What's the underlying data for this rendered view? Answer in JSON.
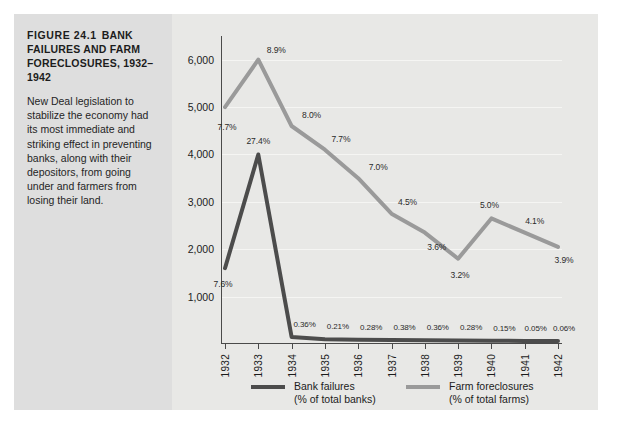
{
  "figure": {
    "number_label": "FIGURE 24.1",
    "title": "BANK FAILURES AND FARM FORECLOSURES, 1932–1942",
    "caption": "New Deal legislation to stabilize the economy had its most immediate and striking effect in preventing banks, along with their depositors, from going under and farmers from losing their land."
  },
  "colors": {
    "bank_failures": "#4c4c4c",
    "farm_foreclosures": "#9a9a9a",
    "panel_background": "#e8e8e6",
    "caption_background": "#dedede",
    "axis": "#4a4a4a",
    "gridline": "#f5f5f3"
  },
  "chart_data": {
    "type": "line",
    "title": "FIGURE 24.1 BANK FAILURES AND FARM FORECLOSURES, 1932–1942",
    "xlabel": "",
    "ylabel": "",
    "x": [
      "1932",
      "1933",
      "1934",
      "1935",
      "1936",
      "1937",
      "1938",
      "1939",
      "1940",
      "1941",
      "1942"
    ],
    "ylim": [
      0,
      6500
    ],
    "yticks": [
      1000,
      2000,
      3000,
      4000,
      5000,
      6000
    ],
    "ytick_labels": [
      "1,000",
      "2,000",
      "3,000",
      "4,000",
      "5,000",
      "6,000"
    ],
    "grid": true,
    "legend_position": "bottom",
    "series": [
      {
        "name": "Bank failures",
        "unit_label": "(% of total banks)",
        "color": "#4c4c4c",
        "values": [
          1600,
          4000,
          150,
          100,
          90,
          85,
          80,
          75,
          70,
          65,
          62
        ],
        "point_labels": [
          "7.6%",
          "27.4%",
          "0.36%",
          "0.21%",
          "0.28%",
          "0.38%",
          "0.36%",
          "0.28%",
          "0.15%",
          "0.05%",
          "0.06%"
        ],
        "percent_values": [
          7.6,
          27.4,
          0.36,
          0.21,
          0.28,
          0.38,
          0.36,
          0.28,
          0.15,
          0.05,
          0.06
        ]
      },
      {
        "name": "Farm foreclosures",
        "unit_label": "(% of total farms)",
        "color": "#9a9a9a",
        "values": [
          5000,
          6000,
          4600,
          4100,
          3500,
          2750,
          2350,
          1800,
          2650,
          2350,
          2050
        ],
        "point_labels": [
          "7.7%",
          "8.9%",
          "8.0%",
          "7.7%",
          "7.0%",
          "4.5%",
          "3.6%",
          "3.2%",
          "5.0%",
          "4.1%",
          "3.9%"
        ],
        "percent_values": [
          7.7,
          8.9,
          8.0,
          7.7,
          7.0,
          4.5,
          3.6,
          3.2,
          5.0,
          4.1,
          3.9
        ]
      }
    ]
  },
  "legend": [
    {
      "name": "Bank failures",
      "unit": "(% of total banks)",
      "color": "#4c4c4c"
    },
    {
      "name": "Farm foreclosures",
      "unit": "(% of total farms)",
      "color": "#9a9a9a"
    }
  ]
}
